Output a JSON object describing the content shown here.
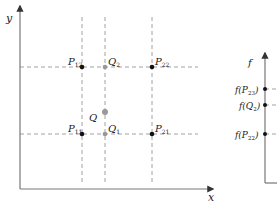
{
  "left_plot": {
    "x_axis_label": "x",
    "y_axis_label": "y",
    "points": [
      {
        "id": "P12",
        "label": "P",
        "sub": "12",
        "x": 82,
        "y": 67,
        "color": "#111111"
      },
      {
        "id": "Q2",
        "label": "Q",
        "sub": "2",
        "x": 105,
        "y": 67,
        "color": "#999999"
      },
      {
        "id": "P22",
        "label": "P",
        "sub": "22",
        "x": 152,
        "y": 67,
        "color": "#111111"
      },
      {
        "id": "Q",
        "label": "Q",
        "sub": "",
        "x": 105,
        "y": 112,
        "color": "#999999"
      },
      {
        "id": "P11",
        "label": "P",
        "sub": "11",
        "x": 82,
        "y": 134,
        "color": "#111111"
      },
      {
        "id": "Q1",
        "label": "Q",
        "sub": "1",
        "x": 105,
        "y": 134,
        "color": "#999999"
      },
      {
        "id": "P21",
        "label": "P",
        "sub": "21",
        "x": 152,
        "y": 134,
        "color": "#111111"
      }
    ]
  },
  "right_plot": {
    "axis_label": "f",
    "ticks": [
      {
        "id": "fP23",
        "text": "f(P",
        "sub": "23",
        "close": ")",
        "y": 89
      },
      {
        "id": "fQ2",
        "text": "f(Q",
        "sub": "2",
        "close": ")",
        "y": 105
      },
      {
        "id": "fP22",
        "text": "f(P",
        "sub": "22",
        "close": ")",
        "y": 134
      }
    ]
  }
}
